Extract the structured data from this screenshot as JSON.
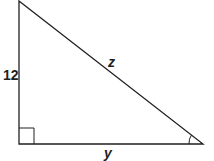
{
  "diagram": {
    "type": "right-triangle",
    "labels": {
      "vertical_leg": "12",
      "hypotenuse": "z",
      "horizontal_leg": "y"
    },
    "markers": {
      "right_angle": "bottom-left",
      "angle_arc": "bottom-right"
    },
    "colors": {
      "stroke": "#231f20"
    }
  }
}
